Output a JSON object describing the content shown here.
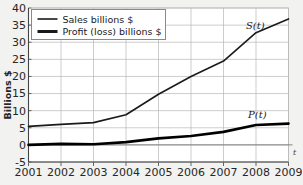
{
  "chart_data": {
    "type": "line",
    "title": "",
    "xlabel": "",
    "ylabel": "Billions $",
    "x_axis_symbol": "t",
    "categories": [
      "2001",
      "2002",
      "2003",
      "2004",
      "2005",
      "2006",
      "2007",
      "2008",
      "2009"
    ],
    "x": [
      2001,
      2002,
      2003,
      2004,
      2005,
      2006,
      2007,
      2008,
      2009
    ],
    "xlim": [
      2001,
      2009
    ],
    "ylim": [
      -5,
      40
    ],
    "y_ticks": [
      40,
      35,
      30,
      25,
      20,
      15,
      10,
      5,
      0,
      -5
    ],
    "x_ticks": [
      "2001",
      "2002",
      "2003",
      "2004",
      "2005",
      "2006",
      "2007",
      "2008",
      "2009"
    ],
    "grid": true,
    "legend_position": "top-left",
    "series": [
      {
        "name": "Sales billions $",
        "curve_label": "S(t)",
        "color": "#1a1a1a",
        "line_width": 1.6,
        "values": [
          5.4,
          6.0,
          6.5,
          8.8,
          14.8,
          20.0,
          24.5,
          32.8,
          36.8
        ]
      },
      {
        "name": "Profit (loss) billions $",
        "curve_label": "P(t)",
        "color": "#000000",
        "line_width": 2.6,
        "values": [
          0.0,
          0.3,
          0.2,
          0.8,
          1.9,
          2.6,
          3.8,
          5.8,
          6.2
        ]
      }
    ],
    "legend": [
      {
        "label": "Sales billions $",
        "swatch_width": 1.6
      },
      {
        "label": "Profit (loss) billions $",
        "swatch_width": 3.0
      }
    ],
    "annotations": [
      {
        "text": "S(t)",
        "series": "Sales billions $"
      },
      {
        "text": "P(t)",
        "series": "Profit (loss) billions $"
      }
    ],
    "colors": {
      "background": "#f2f2f0",
      "plot_background": "#ffffff",
      "grid": "#b8b8b8",
      "axis": "#555555",
      "text": "#262626",
      "legend_background": "#ffffff",
      "legend_border": "#8a8a8a"
    }
  }
}
